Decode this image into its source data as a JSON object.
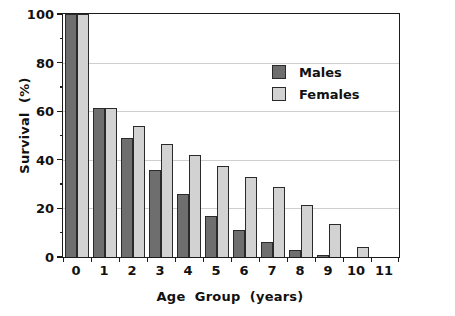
{
  "chart_data": {
    "type": "bar",
    "title": "",
    "xlabel": "Age  Group  (years)",
    "ylabel": "Survival  (%)",
    "categories": [
      "0",
      "1",
      "2",
      "3",
      "4",
      "5",
      "6",
      "7",
      "8",
      "9",
      "10",
      "11"
    ],
    "series": [
      {
        "name": "Males",
        "color": "#6e6e6e",
        "values": [
          100,
          61.5,
          49,
          36,
          26,
          17,
          11,
          6,
          3,
          1,
          0,
          0
        ]
      },
      {
        "name": "Females",
        "color": "#d2d2d2",
        "values": [
          100,
          61.5,
          54,
          46.5,
          42,
          37.5,
          33,
          29,
          21.5,
          13.5,
          4,
          0
        ]
      }
    ],
    "ylim": [
      0,
      100
    ],
    "y_ticks": [
      0,
      20,
      40,
      60,
      80,
      100
    ],
    "y_tick_labels": [
      "0",
      "20",
      "40",
      "60",
      "80",
      "100"
    ],
    "y_minor_ticks": [
      10,
      30,
      50,
      70,
      90
    ],
    "x_tick_labels": [
      "0",
      "1",
      "2",
      "3",
      "4",
      "5",
      "6",
      "7",
      "8",
      "9",
      "10",
      "11"
    ],
    "grid": "horizontal",
    "gridline_values": [
      20,
      40,
      60,
      80
    ],
    "legend_position": "upper-right",
    "legend_entries": [
      "Males",
      "Females"
    ],
    "axis_color": "#1c1c1c",
    "grid_color": "#cfcfcf",
    "background": "#ffffff"
  }
}
